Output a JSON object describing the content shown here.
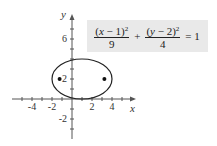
{
  "figure": {
    "axes": {
      "x_label": "x",
      "y_label": "y",
      "x_ticks": [
        "-4",
        "-2",
        "2",
        "4"
      ],
      "y_ticks": [
        "6",
        "2",
        "-2"
      ]
    },
    "equation": {
      "term1_num_var": "x",
      "term1_num_const": "1",
      "term1_den": "9",
      "plus": "+",
      "term2_num_var": "y",
      "term2_num_const": "2",
      "term2_den": "4",
      "exponent": "2",
      "equals": "= 1"
    },
    "ellipse": {
      "center": [
        1,
        2
      ],
      "a": 3,
      "b": 2,
      "foci": [
        [
          -1.24,
          2
        ],
        [
          3.24,
          2
        ]
      ]
    },
    "colors": {
      "stroke": "#222222",
      "equation_box_bg": "#e9e9e9"
    }
  }
}
